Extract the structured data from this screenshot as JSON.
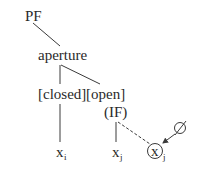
{
  "diagram": {
    "type": "feature-tree",
    "root": "PF",
    "nodes": {
      "pf": "PF",
      "aperture": "aperture",
      "closed": "[closed]",
      "open": "[open]",
      "if": "(IF)",
      "xi_base": "x",
      "xi_sub": "i",
      "xj_base": "x",
      "xj_sub": "j",
      "xj_circled_base": "x",
      "xj_circled_sub": "j",
      "empty": "∅"
    },
    "edges": [
      {
        "from": "PF",
        "to": "aperture",
        "style": "solid"
      },
      {
        "from": "aperture",
        "to": "[closed]",
        "style": "solid"
      },
      {
        "from": "aperture",
        "to": "[open]",
        "style": "solid"
      },
      {
        "from": "[closed]",
        "to": "x_i",
        "style": "solid"
      },
      {
        "from": "(IF)",
        "to": "x_j",
        "style": "solid"
      },
      {
        "from": "(IF)",
        "to": "circled x_j",
        "style": "dashed"
      },
      {
        "from": "∅",
        "to": "circled x_j",
        "style": "arrow"
      }
    ],
    "colors": {
      "text": "#2a2a2a",
      "line": "#3a3a3a",
      "background": "#ffffff"
    }
  }
}
